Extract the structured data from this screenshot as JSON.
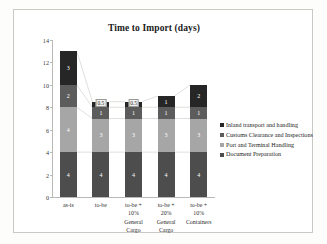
{
  "chart_data": {
    "type": "bar",
    "subtype": "stacked-bar",
    "title": "Time to Import  (days)",
    "xlabel": "",
    "ylabel": "",
    "ylim": [
      0,
      14
    ],
    "yticks": [
      0,
      2,
      4,
      6,
      8,
      10,
      12,
      14
    ],
    "ytick_labels": [
      "0",
      "2",
      "4",
      "6",
      "8",
      "10",
      "12",
      "14"
    ],
    "grid": false,
    "legend_position": "right",
    "stack_order_bottom_to_top": [
      "Document Preparation",
      "Port and Terminal Handling",
      "Customs Clearance and Inspections",
      "Inland transport and handling"
    ],
    "categories": [
      "as-is",
      "to-be",
      "to-be + 10% General Cargo",
      "to-be + 20% General Cargo",
      "to-be + 10% Containers"
    ],
    "category_lines": [
      [
        "as-is"
      ],
      [
        "to-be"
      ],
      [
        "to-be +",
        "10%",
        "General",
        "Cargo"
      ],
      [
        "to-be +",
        "20%",
        "General",
        "Cargo"
      ],
      [
        "to-be +",
        "10%",
        "Containers"
      ]
    ],
    "series": [
      {
        "name": "Inland transport and handling",
        "color": "#262626",
        "values": [
          3,
          0.5,
          0.5,
          1,
          2
        ],
        "labels": [
          "3",
          "0.5",
          "0.5",
          "1",
          "2"
        ]
      },
      {
        "name": "Customs Clearance and Inspections",
        "color": "#5c5c5c",
        "values": [
          2,
          1,
          1,
          1,
          1
        ],
        "labels": [
          "2",
          "1",
          "1",
          "1",
          "1"
        ]
      },
      {
        "name": "Port and Terminal Handling",
        "color": "#a6a6a6",
        "values": [
          4,
          3,
          3,
          3,
          3
        ],
        "labels": [
          "4",
          "3",
          "3",
          "3",
          "3"
        ]
      },
      {
        "name": "Document Preparation",
        "color": "#4d4d4d",
        "values": [
          4,
          4,
          4,
          4,
          4
        ],
        "labels": [
          "4",
          "4",
          "4",
          "4",
          "4"
        ]
      }
    ],
    "totals": [
      13,
      8.5,
      8.5,
      9,
      10
    ]
  },
  "legend": {
    "items": [
      {
        "label": "Inland transport and handling",
        "color": "#262626"
      },
      {
        "label": "Customs Clearance and Inspections",
        "color": "#5c5c5c"
      },
      {
        "label": "Port and Terminal Handling",
        "color": "#a6a6a6"
      },
      {
        "label": "Document Preparation",
        "color": "#4d4d4d"
      }
    ]
  }
}
